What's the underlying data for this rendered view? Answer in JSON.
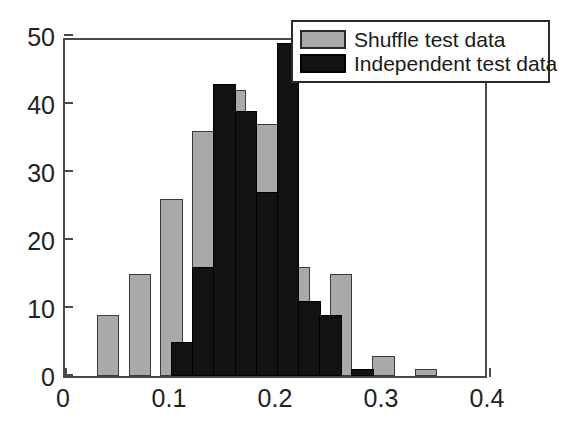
{
  "chart_data": {
    "type": "bar",
    "title": "",
    "xlabel": "",
    "ylabel": "",
    "xlim": [
      0,
      0.4
    ],
    "ylim": [
      0,
      50
    ],
    "xticks": [
      "0",
      "0.1",
      "0.2",
      "0.3",
      "0.4"
    ],
    "xtick_values": [
      0,
      0.1,
      0.2,
      0.3,
      0.4
    ],
    "yticks": [
      "0",
      "10",
      "20",
      "30",
      "40",
      "50"
    ],
    "ytick_values": [
      0,
      10,
      20,
      30,
      40,
      50
    ],
    "grid": false,
    "legend_position": "top-right",
    "bin_width": 0.02,
    "series": [
      {
        "name": "Shuffle test data",
        "color": "#a9a9a9",
        "bin_starts": [
          0.03,
          0.06,
          0.09,
          0.12,
          0.15,
          0.18,
          0.21,
          0.25,
          0.29,
          0.33
        ],
        "bin_width": 0.0212,
        "values": [
          9,
          15,
          26,
          36,
          42,
          37,
          16,
          15,
          3,
          1
        ]
      },
      {
        "name": "Independent test data",
        "color": "#121212",
        "bin_starts": [
          0.1,
          0.12,
          0.14,
          0.16,
          0.18,
          0.2,
          0.22,
          0.24,
          0.27
        ],
        "bin_width": 0.0212,
        "values": [
          5,
          16,
          43,
          39,
          27,
          49,
          11,
          9,
          1
        ]
      }
    ]
  },
  "legend": {
    "entries": [
      {
        "label": "Shuffle test data",
        "swatch": "gray-swatch"
      },
      {
        "label": "Independent test data",
        "swatch": "black-swatch"
      }
    ]
  }
}
